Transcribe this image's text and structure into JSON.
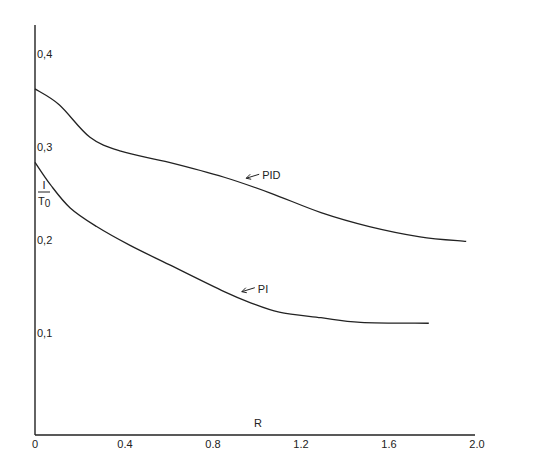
{
  "chart_data": {
    "type": "line",
    "title": "",
    "xlabel": "R",
    "ylabel": "I / T0",
    "ylabel_numerator": "I",
    "ylabel_denominator": "T",
    "ylabel_denominator_sub": "0",
    "xlim": [
      0,
      2.0
    ],
    "ylim": [
      0,
      0.43
    ],
    "grid": false,
    "legend": "inline labels with arrows",
    "x_ticks": [
      0,
      0.4,
      0.8,
      1.2,
      1.6,
      2.0
    ],
    "x_tick_labels": [
      "0",
      "0.4",
      "0.8",
      "1.2",
      "1.6",
      "2.0"
    ],
    "y_ticks": [
      0.1,
      0.2,
      0.3,
      0.4
    ],
    "y_tick_labels": [
      "0,1",
      "0,2",
      "0,3",
      "0,4"
    ],
    "series": [
      {
        "name": "PID",
        "label_x": 0.96,
        "label_y": 0.275,
        "x": [
          0,
          0.11,
          0.25,
          0.39,
          0.61,
          0.86,
          1.07,
          1.3,
          1.52,
          1.75,
          1.96
        ],
        "y": [
          0.37,
          0.353,
          0.318,
          0.303,
          0.291,
          0.275,
          0.258,
          0.237,
          0.222,
          0.211,
          0.206
        ]
      },
      {
        "name": "PI",
        "label_x": 0.94,
        "label_y": 0.153,
        "x": [
          0,
          0.07,
          0.16,
          0.28,
          0.43,
          0.61,
          0.86,
          0.98,
          1.11,
          1.3,
          1.48,
          1.79
        ],
        "y": [
          0.291,
          0.267,
          0.242,
          0.222,
          0.202,
          0.181,
          0.152,
          0.14,
          0.13,
          0.124,
          0.119,
          0.118
        ]
      }
    ]
  }
}
